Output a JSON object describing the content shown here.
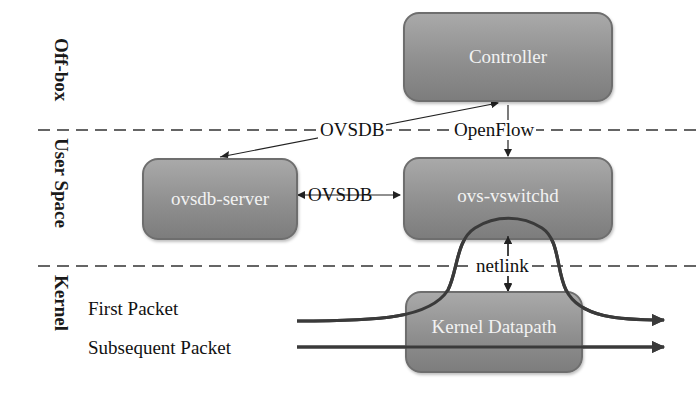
{
  "regions": [
    {
      "label": "Off-box"
    },
    {
      "label": "User Space"
    },
    {
      "label": "Kernel"
    }
  ],
  "nodes": {
    "controller": {
      "label": "Controller"
    },
    "ovsdb_server": {
      "label": "ovsdb-server"
    },
    "ovs_vswitchd": {
      "label": "ovs-vswitchd"
    },
    "kernel_datapath": {
      "label": "Kernel Datapath"
    }
  },
  "edges": {
    "ovsdb_controller": {
      "label": "OVSDB"
    },
    "openflow": {
      "label": "OpenFlow"
    },
    "ovsdb_local": {
      "label": "OVSDB"
    },
    "netlink": {
      "label": "netlink"
    }
  },
  "packets": [
    {
      "label": "First Packet"
    },
    {
      "label": "Subsequent Packet"
    }
  ],
  "colors": {
    "node_fill": "#8f8f8f",
    "node_border": "#6e6e6e",
    "node_text": "#f2f2f2",
    "line": "#2a2a2a",
    "packet_line": "#3a3a3a"
  }
}
